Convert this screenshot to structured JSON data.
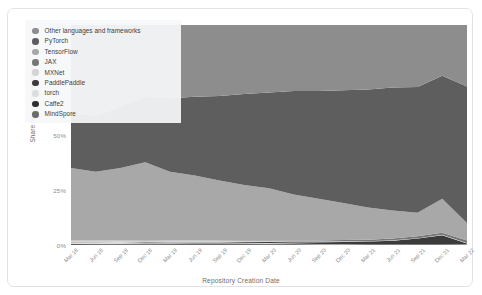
{
  "chart_data": {
    "type": "area",
    "stacked": true,
    "title": "",
    "xlabel": "Repository Creation Date",
    "ylabel": "Share of implementations",
    "ylim": [
      0,
      100
    ],
    "yticks": [
      "0%",
      "25%",
      "50%",
      "75%",
      "100%"
    ],
    "ytick_values": [
      0,
      25,
      50,
      75,
      100
    ],
    "grid": false,
    "legend_position": "upper-left-inside",
    "categories": [
      "Mar 18",
      "Jun 18",
      "Sep 18",
      "Dec 18",
      "Mar 19",
      "Jun 19",
      "Sep 19",
      "Dec 19",
      "Mar 20",
      "Jun 20",
      "Sep 20",
      "Dec 20",
      "Mar 21",
      "Jun 21",
      "Sep 21",
      "Dec 21",
      "Mar 22"
    ],
    "series": [
      {
        "name": "Other languages and frameworks",
        "color": "#8d8d8d",
        "values": [
          40,
          41,
          37,
          33,
          33,
          32,
          32,
          31,
          31,
          30,
          30,
          30,
          30,
          29,
          29,
          24,
          28
        ]
      },
      {
        "name": "PyTorch",
        "color": "#5e5e5e",
        "values": [
          25,
          25,
          28,
          30,
          33,
          35,
          38,
          41,
          44,
          47,
          49,
          52,
          55,
          57,
          59,
          58,
          62
        ]
      },
      {
        "name": "TensorFlow",
        "color": "#a8a8a8",
        "values": [
          33,
          31,
          33,
          36,
          31,
          29,
          27,
          25,
          24,
          21,
          19,
          17,
          15,
          13,
          11,
          16,
          8
        ]
      },
      {
        "name": "JAX",
        "color": "#767676",
        "values": [
          0,
          0,
          0,
          0,
          0,
          0,
          0.1,
          0.2,
          0.3,
          0.4,
          0.5,
          0.6,
          0.7,
          0.8,
          0.9,
          1.0,
          1.1
        ]
      },
      {
        "name": "MXNet",
        "color": "#d4d4d4",
        "values": [
          0.8,
          0.8,
          0.7,
          0.6,
          0.6,
          0.5,
          0.5,
          0.4,
          0.4,
          0.3,
          0.3,
          0.3,
          0.2,
          0.2,
          0.2,
          0.2,
          0.2
        ]
      },
      {
        "name": "PaddlePaddle",
        "color": "#3b3b3b",
        "values": [
          0.1,
          0.1,
          0.1,
          0.2,
          0.2,
          0.3,
          0.3,
          0.4,
          0.5,
          0.6,
          0.8,
          0.9,
          1.2,
          1.6,
          2.6,
          4.2,
          0.4
        ]
      },
      {
        "name": "torch",
        "color": "#dedede",
        "values": [
          0.7,
          0.6,
          0.6,
          0.5,
          0.5,
          0.4,
          0.4,
          0.3,
          0.3,
          0.2,
          0.2,
          0.2,
          0.1,
          0.1,
          0.1,
          0.1,
          0.1
        ]
      },
      {
        "name": "Caffe2",
        "color": "#2e2e2e",
        "values": [
          0.3,
          0.3,
          0.3,
          0.3,
          0.2,
          0.2,
          0.2,
          0.2,
          0.2,
          0.2,
          0.1,
          0.1,
          0.1,
          0.1,
          0.1,
          0.1,
          0.1
        ]
      },
      {
        "name": "MindSpore",
        "color": "#6b6b6b",
        "values": [
          0.1,
          0.2,
          0.3,
          0.4,
          0.5,
          0.6,
          0.6,
          0.5,
          0.4,
          0.3,
          0.2,
          0.2,
          0.2,
          0.2,
          0.2,
          0.2,
          0.1
        ]
      }
    ]
  },
  "axes": {
    "ylabel": "Share of implementations",
    "xlabel": "Repository Creation Date"
  },
  "legend": {
    "items": [
      {
        "label": "Other languages and frameworks",
        "color": "#8d8d8d"
      },
      {
        "label": "PyTorch",
        "color": "#5e5e5e"
      },
      {
        "label": "TensorFlow",
        "color": "#a8a8a8"
      },
      {
        "label": "JAX",
        "color": "#767676"
      },
      {
        "label": "MXNet",
        "color": "#d4d4d4"
      },
      {
        "label": "PaddlePaddle",
        "color": "#3b3b3b"
      },
      {
        "label": "torch",
        "color": "#dedede"
      },
      {
        "label": "Caffe2",
        "color": "#2e2e2e"
      },
      {
        "label": "MindSpore",
        "color": "#6b6b6b"
      }
    ]
  }
}
